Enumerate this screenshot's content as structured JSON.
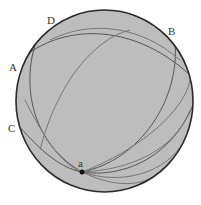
{
  "diagram": {
    "sphere": {
      "cx": 104.5,
      "cy": 101,
      "rx": 88.5,
      "ry": 91,
      "fill": "#bdbdbd",
      "stroke": "#2a2a2a"
    },
    "point": {
      "label": "a",
      "x": 82,
      "y": 172,
      "color": "#111111"
    },
    "labels": [
      {
        "id": "D",
        "text": "D",
        "x": 47,
        "y": 15
      },
      {
        "id": "B",
        "text": "B",
        "x": 168,
        "y": 26
      },
      {
        "id": "A",
        "text": "A",
        "x": 9,
        "y": 62
      },
      {
        "id": "C",
        "text": "C",
        "x": 8,
        "y": 123
      },
      {
        "id": "a",
        "text": "a",
        "x": 78,
        "y": 158
      }
    ],
    "curve_color": "#555555"
  }
}
